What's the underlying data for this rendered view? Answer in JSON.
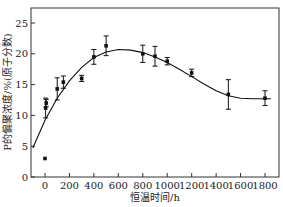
{
  "chart_data": {
    "type": "scatter",
    "title": "",
    "xlabel": "恒温时间/h",
    "ylabel": "P的偏聚浓度/%(原子分数)",
    "xlim": [
      -100,
      1850
    ],
    "ylim": [
      0,
      27
    ],
    "grid": false,
    "legend": "none",
    "x_ticks": [
      0,
      200,
      400,
      600,
      800,
      1000,
      1200,
      1400,
      1600,
      1800
    ],
    "y_ticks": [
      0,
      5,
      10,
      15,
      20,
      25
    ],
    "series": [
      {
        "name": "measured",
        "kind": "points_with_error_bars",
        "points": [
          {
            "x": 0,
            "y": 3.0,
            "err": 0.2
          },
          {
            "x": 5,
            "y": 11.2,
            "err": 1.6
          },
          {
            "x": 10,
            "y": 12.0,
            "err": 0.6
          },
          {
            "x": 100,
            "y": 14.3,
            "err": 1.8
          },
          {
            "x": 150,
            "y": 15.4,
            "err": 1.0
          },
          {
            "x": 300,
            "y": 16.0,
            "err": 0.5
          },
          {
            "x": 400,
            "y": 19.5,
            "err": 1.2
          },
          {
            "x": 500,
            "y": 21.3,
            "err": 1.6
          },
          {
            "x": 800,
            "y": 20.0,
            "err": 1.4
          },
          {
            "x": 900,
            "y": 19.6,
            "err": 1.6
          },
          {
            "x": 1000,
            "y": 18.8,
            "err": 0.6
          },
          {
            "x": 1200,
            "y": 16.9,
            "err": 0.6
          },
          {
            "x": 1500,
            "y": 13.4,
            "err": 2.4
          },
          {
            "x": 1800,
            "y": 12.8,
            "err": 1.2
          }
        ]
      },
      {
        "name": "fit",
        "kind": "line",
        "x": [
          -100,
          0,
          100,
          200,
          300,
          400,
          500,
          600,
          700,
          800,
          900,
          1000,
          1100,
          1200,
          1300,
          1400,
          1500,
          1600,
          1700,
          1800,
          1850
        ],
        "y": [
          4.7,
          9.2,
          12.8,
          15.6,
          17.8,
          19.4,
          20.3,
          20.7,
          20.6,
          20.2,
          19.5,
          18.6,
          17.5,
          16.3,
          15.1,
          14.0,
          13.2,
          12.8,
          12.7,
          12.7,
          12.7
        ]
      }
    ]
  }
}
